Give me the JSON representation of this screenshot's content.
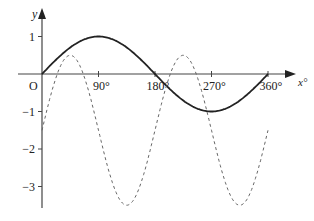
{
  "chart_data": {
    "type": "line",
    "title": "",
    "xlabel": "x°",
    "ylabel": "y",
    "origin_label": "O",
    "xlim": [
      0,
      360
    ],
    "ylim": [
      -3.5,
      1
    ],
    "grid": false,
    "legend": null,
    "x_ticks": [
      90,
      180,
      270,
      360
    ],
    "x_tick_labels": [
      "90°",
      "180°",
      "270°",
      "360°"
    ],
    "y_ticks": [
      1,
      -1,
      -2,
      -3
    ],
    "y_tick_labels": [
      "1",
      "−1",
      "−2",
      "−3"
    ],
    "series": [
      {
        "name": "solid curve",
        "style": "solid",
        "color": "#222222",
        "description": "y = sin x",
        "x": [
          0,
          45,
          90,
          135,
          180,
          225,
          270,
          315,
          360
        ],
        "values": [
          0,
          0.71,
          1,
          0.71,
          0,
          -0.71,
          -1,
          -0.71,
          0
        ]
      },
      {
        "name": "dashed curve",
        "style": "dashed",
        "color": "#666666",
        "description": "y = 2 sin 2x − 1.5",
        "x": [
          0,
          45,
          90,
          135,
          180,
          225,
          270,
          315,
          360
        ],
        "values": [
          -1.5,
          0.5,
          -1.5,
          -3.5,
          -1.5,
          0.5,
          -1.5,
          -3.5,
          -1.5
        ]
      }
    ]
  }
}
